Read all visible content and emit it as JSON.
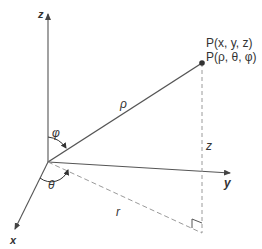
{
  "diagram": {
    "colors": {
      "line": "#555555",
      "dashed": "#9a9a9a",
      "text": "#333333",
      "point": "#333333"
    },
    "axes": {
      "z_label": "z",
      "x_label": "x",
      "y_label": "y"
    },
    "point": {
      "cartesian_label": "P(x, y, z)",
      "spherical_label": "P(ρ, θ, φ)"
    },
    "segments": {
      "rho_label": "ρ",
      "height_label": "z",
      "projection_label": "r"
    },
    "angles": {
      "phi_label": "φ",
      "theta_label": "θ"
    }
  }
}
